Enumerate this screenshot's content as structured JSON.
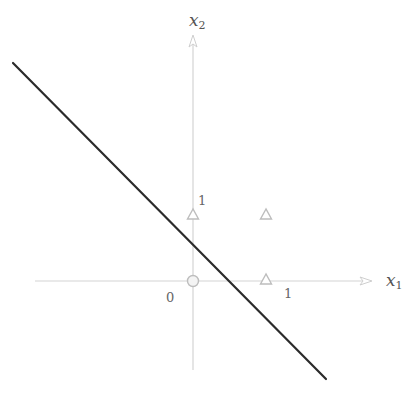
{
  "diagram": {
    "colors": {
      "background": "#ffffff",
      "axis": "#d4d4d4",
      "boundary_line": "#2b2b2b",
      "marker_fill": "#ffffff",
      "marker_stroke": "#bdbdbd",
      "label": "#555555"
    },
    "axes": {
      "x": {
        "name": "x",
        "subscript": "1"
      },
      "y": {
        "name": "x",
        "subscript": "2"
      }
    },
    "ticks": {
      "origin": "0",
      "x_one": "1",
      "y_one": "1"
    },
    "points": [
      {
        "x": 0,
        "y": 0,
        "marker": "circle"
      },
      {
        "x": 0,
        "y": 1,
        "marker": "triangle"
      },
      {
        "x": 1,
        "y": 0,
        "marker": "triangle"
      },
      {
        "x": 1,
        "y": 1,
        "marker": "triangle"
      }
    ],
    "boundary": {
      "type": "line",
      "description": "x1 + x2 = 0.5 (approx.)",
      "from_px": [
        13,
        63
      ],
      "to_px": [
        326,
        379
      ]
    }
  }
}
